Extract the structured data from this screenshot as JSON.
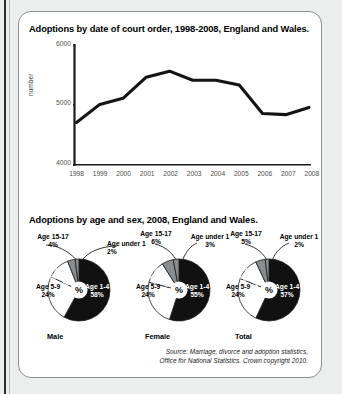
{
  "left_rule": "",
  "panels": {
    "line_title": "Adoptions by date of court order, 1998-2008, England and Wales.",
    "pies_title": "Adoptions by age and sex, 2008, England and Wales."
  },
  "source": {
    "line1": "Source: Marriage, divorce and adoption statistics,",
    "line2": "Office for National Statistics. Crown copyright 2010."
  },
  "colors": {
    "slice_dark": "#111111",
    "slice_white": "#ffffff",
    "slice_gray": "#8a8d8f",
    "line": "#141414",
    "axis": "#1a1a1a",
    "card_bg": "#ffffff",
    "page_bg": "#eceded"
  },
  "chart_data": [
    {
      "type": "line",
      "title": "Adoptions by date of court order, 1998-2008, England and Wales.",
      "xlabel": "",
      "ylabel": "number",
      "ylim": [
        4000,
        6000
      ],
      "yticks": [
        4000,
        5000,
        6000
      ],
      "ytick_labels": [
        "4000",
        "5000",
        "6000"
      ],
      "grid": false,
      "legend": "none",
      "categories": [
        "1998",
        "1999",
        "2000",
        "2001",
        "2002",
        "2003",
        "2004",
        "2005",
        "2006",
        "2007",
        "2008"
      ],
      "x": [
        1998,
        1999,
        2000,
        2001,
        2002,
        2003,
        2004,
        2005,
        2006,
        2007,
        2008
      ],
      "values": [
        4700,
        5000,
        5100,
        5450,
        5550,
        5400,
        5400,
        5320,
        4850,
        4830,
        4950
      ]
    },
    {
      "type": "pie",
      "title": "Adoptions by age and sex, 2008, England and Wales.",
      "name": "Male",
      "labels": [
        "Age under 1",
        "Age 1-4",
        "Age 5-9",
        "Age 10-14",
        "Age 15-17"
      ],
      "values": [
        2,
        58,
        24,
        12,
        4
      ],
      "value_labels": [
        "2%",
        "58%",
        "24%",
        "12%",
        "4%"
      ],
      "center_label": "%"
    },
    {
      "type": "pie",
      "name": "Female",
      "labels": [
        "Age under 1",
        "Age 1-4",
        "Age 5-9",
        "Age 10-14",
        "Age 15-17"
      ],
      "values": [
        3,
        55,
        24,
        12,
        6
      ],
      "value_labels": [
        "3%",
        "55%",
        "24%",
        "12%",
        "6%"
      ],
      "center_label": "%"
    },
    {
      "type": "pie",
      "name": "Total",
      "labels": [
        "Age under 1",
        "Age 1-4",
        "Age 5-9",
        "Age 10-14",
        "Age 15-17"
      ],
      "values": [
        2,
        57,
        24,
        12,
        5
      ],
      "value_labels": [
        "2%",
        "57%",
        "24%",
        "12%",
        "5%"
      ],
      "center_label": "%"
    }
  ],
  "pies": [
    {
      "name": "Male",
      "center_label": "%",
      "outside": [
        {
          "name": "age-15-17",
          "label": "Age 15-17",
          "pct": "4%"
        },
        {
          "name": "age-under-1",
          "label": "Age under 1",
          "pct": "2%"
        }
      ],
      "inside": [
        {
          "name": "age-1-4",
          "label": "Age 1-4",
          "pct": "58%"
        },
        {
          "name": "age-5-9",
          "label": "Age 5-9",
          "pct": "24%"
        },
        {
          "name": "age-10-14",
          "label": "Age 10-14",
          "pct": "12%"
        }
      ]
    },
    {
      "name": "Female",
      "center_label": "%",
      "outside": [
        {
          "name": "age-15-17",
          "label": "Age 15-17",
          "pct": "6%"
        },
        {
          "name": "age-under-1",
          "label": "Age under 1",
          "pct": "3%"
        }
      ],
      "inside": [
        {
          "name": "age-1-4",
          "label": "Age 1-4",
          "pct": "55%"
        },
        {
          "name": "age-5-9",
          "label": "Age 5-9",
          "pct": "24%"
        },
        {
          "name": "age-10-14",
          "label": "Age 10-14",
          "pct": "12%"
        }
      ]
    },
    {
      "name": "Total",
      "center_label": "%",
      "outside": [
        {
          "name": "age-15-17",
          "label": "Age 15-17",
          "pct": "5%"
        },
        {
          "name": "age-under-1",
          "label": "Age under 1",
          "pct": "2%"
        }
      ],
      "inside": [
        {
          "name": "age-1-4",
          "label": "Age 1-4",
          "pct": "57%"
        },
        {
          "name": "age-5-9",
          "label": "Age 5-9",
          "pct": "24%"
        },
        {
          "name": "age-10-14",
          "label": "Age 10-14",
          "pct": "12%"
        }
      ]
    }
  ]
}
